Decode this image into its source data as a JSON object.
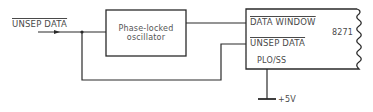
{
  "diagram": {
    "title": "",
    "input": {
      "label": "UNSEP DATA",
      "overline": true
    },
    "oscillator": {
      "label_line1": "Phase-locked",
      "label_line2": "oscillator"
    },
    "chip": {
      "name": "8271",
      "pins": [
        {
          "label": "DATA WINDOW",
          "overline": true
        },
        {
          "label": "UNSEP DATA",
          "overline": true
        },
        {
          "label": "PLO/SS",
          "overline": false
        }
      ]
    },
    "supply": {
      "label": "+5V"
    },
    "colors": {
      "line": "#2a2a2a",
      "text": "#4a4a4a",
      "background": "#ffffff"
    }
  }
}
